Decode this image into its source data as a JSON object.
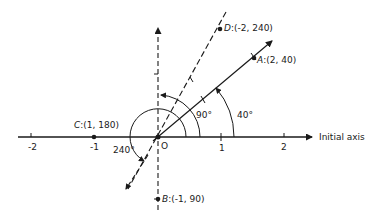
{
  "axis": {
    "label": "Initial axis",
    "ticks": [
      "-2",
      "-1",
      "0",
      "1",
      "2"
    ],
    "origin_label": "O"
  },
  "points": [
    {
      "name": "A",
      "coords": "(2, 40)",
      "r": 2,
      "theta": 40
    },
    {
      "name": "B",
      "coords": "(-1, 90)",
      "r": -1,
      "theta": 90
    },
    {
      "name": "C",
      "coords": "(1, 180)",
      "r": 1,
      "theta": 180
    },
    {
      "name": "D",
      "coords": "(-2, 240)",
      "r": -2,
      "theta": 240
    }
  ],
  "angles": {
    "a40": "40°",
    "a90": "90°",
    "a240": "240°"
  },
  "colors": {
    "line": "#1a1a1a",
    "background": "#ffffff"
  }
}
